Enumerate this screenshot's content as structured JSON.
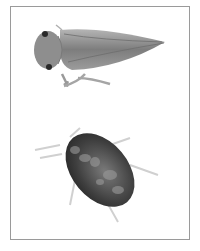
{
  "figure": {
    "subjects": [
      {
        "name": "leafhopper",
        "view": "dorsal",
        "position": "top"
      },
      {
        "name": "mite",
        "view": "dorsal",
        "position": "bottom"
      }
    ],
    "colors": {
      "frame": "#9a9a9a",
      "background": "#ffffff",
      "leafhopper_body": "#8a8a8a",
      "mite_body": "#4a4a4a"
    }
  }
}
